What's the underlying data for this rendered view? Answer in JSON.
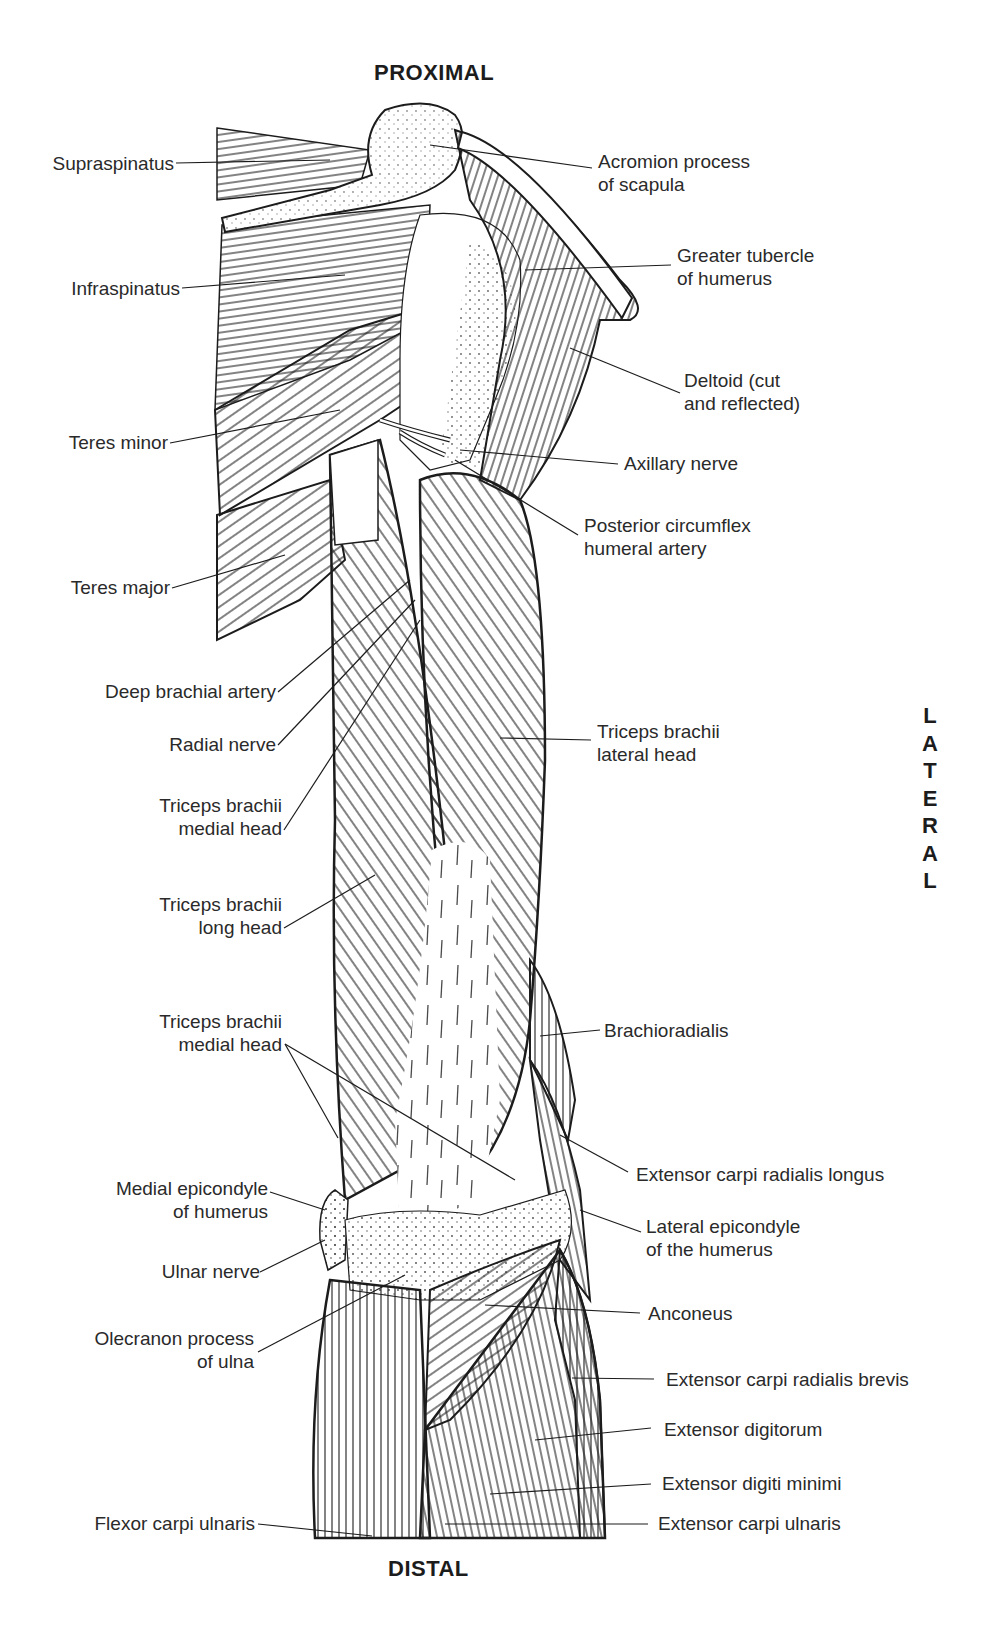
{
  "orientation": {
    "top": "PROXIMAL",
    "bottom": "DISTAL",
    "right_letters": [
      "L",
      "A",
      "T",
      "E",
      "R",
      "A",
      "L"
    ],
    "right": "LATERAL"
  },
  "labels_left": [
    {
      "id": "supraspinatus",
      "lines": [
        "Supraspinatus"
      ]
    },
    {
      "id": "infraspinatus",
      "lines": [
        "Infraspinatus"
      ]
    },
    {
      "id": "teres-minor",
      "lines": [
        "Teres minor"
      ]
    },
    {
      "id": "teres-major",
      "lines": [
        "Teres major"
      ]
    },
    {
      "id": "deep-brachial-artery",
      "lines": [
        "Deep brachial artery"
      ]
    },
    {
      "id": "radial-nerve",
      "lines": [
        "Radial nerve"
      ]
    },
    {
      "id": "triceps-medial-head-upper",
      "lines": [
        "Triceps brachii",
        "medial head"
      ]
    },
    {
      "id": "triceps-long-head",
      "lines": [
        "Triceps brachii",
        "long head"
      ]
    },
    {
      "id": "triceps-medial-head-lower",
      "lines": [
        "Triceps brachii",
        "medial head"
      ]
    },
    {
      "id": "medial-epicondyle",
      "lines": [
        "Medial epicondyle",
        "of humerus"
      ]
    },
    {
      "id": "ulnar-nerve",
      "lines": [
        "Ulnar nerve"
      ]
    },
    {
      "id": "olecranon",
      "lines": [
        "Olecranon process",
        "of ulna"
      ]
    },
    {
      "id": "flexor-carpi-ulnaris",
      "lines": [
        "Flexor carpi ulnaris"
      ]
    }
  ],
  "labels_right": [
    {
      "id": "acromion",
      "lines": [
        "Acromion process",
        "of scapula"
      ]
    },
    {
      "id": "greater-tubercle",
      "lines": [
        "Greater tubercle",
        "of humerus"
      ]
    },
    {
      "id": "deltoid",
      "lines": [
        "Deltoid (cut",
        "and reflected)"
      ]
    },
    {
      "id": "axillary-nerve",
      "lines": [
        "Axillary nerve"
      ]
    },
    {
      "id": "posterior-circumflex",
      "lines": [
        "Posterior circumflex",
        "humeral artery"
      ]
    },
    {
      "id": "triceps-lateral-head",
      "lines": [
        "Triceps brachii",
        "lateral head"
      ]
    },
    {
      "id": "brachioradialis",
      "lines": [
        "Brachioradialis"
      ]
    },
    {
      "id": "ecrl",
      "lines": [
        "Extensor carpi radialis longus"
      ]
    },
    {
      "id": "lateral-epicondyle",
      "lines": [
        "Lateral epicondyle",
        "of the humerus"
      ]
    },
    {
      "id": "anconeus",
      "lines": [
        "Anconeus"
      ]
    },
    {
      "id": "ecrb",
      "lines": [
        "Extensor carpi radialis brevis"
      ]
    },
    {
      "id": "extensor-digitorum",
      "lines": [
        "Extensor digitorum"
      ]
    },
    {
      "id": "extensor-digiti-minimi",
      "lines": [
        "Extensor digiti minimi"
      ]
    },
    {
      "id": "ecu",
      "lines": [
        "Extensor carpi ulnaris"
      ]
    }
  ],
  "colors": {
    "ink": "#1c1c1c",
    "label": "#2a2a2a",
    "background": "#ffffff"
  }
}
